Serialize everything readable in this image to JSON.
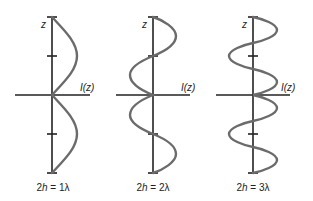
{
  "diagram": {
    "axis_labels": {
      "vertical": "z",
      "horizontal": "I(z)"
    },
    "colors": {
      "axis": "#222222",
      "curve": "#6b6b6b",
      "background": "#ffffff"
    },
    "panels": [
      {
        "id": "p1",
        "caption_prefix": "2",
        "caption_var": "h",
        "caption_rest": " = 1λ",
        "caption": "2h = 1λ",
        "wavelengths": 1
      },
      {
        "id": "p2",
        "caption_prefix": "2",
        "caption_var": "h",
        "caption_rest": " = 2λ",
        "caption": "2h = 2λ",
        "wavelengths": 2
      },
      {
        "id": "p3",
        "caption_prefix": "2",
        "caption_var": "h",
        "caption_rest": " = 3λ",
        "caption": "2h = 3λ",
        "wavelengths": 3
      }
    ]
  }
}
